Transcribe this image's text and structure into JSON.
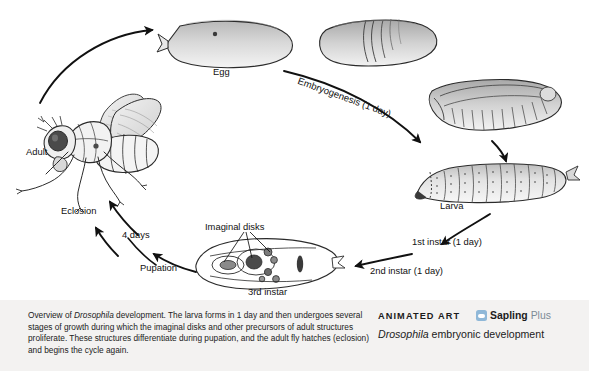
{
  "figure": {
    "background": "#ffffff"
  },
  "stages": {
    "egg": "Egg",
    "larva": "Larva",
    "adult": "Adult",
    "third_instar": "3rd instar"
  },
  "transitions": {
    "embryogenesis": "Embryogenesis (1 day)",
    "first_instar": "1st instar (1 day)",
    "second_instar": "2nd instar (1 day)",
    "pupation": "Pupation",
    "pupal_duration": "4 days",
    "eclosion": "Eclosion"
  },
  "annotations": {
    "imaginal_disks": "Imaginal disks"
  },
  "caption": {
    "part1": "Overview of ",
    "italic1": "Drosophila",
    "part2": " development. The larva forms in 1 day and then undergoes several stages of growth during which the imaginal disks and other precursors of adult structures proliferate. These structures differentiate during pupation, and the adult fly hatches (eclosion) and begins the cycle again."
  },
  "branding": {
    "animated_art_label": "ANIMATED ART",
    "sapling_word": "Sapling",
    "plus_word": "Plus",
    "media_title_italic": "Drosophila",
    "media_title_rest": " embryonic development",
    "logo_icon": "sapling-logo-icon",
    "accent_color": "#8fb8d8",
    "band_color": "#f3f2f1"
  }
}
